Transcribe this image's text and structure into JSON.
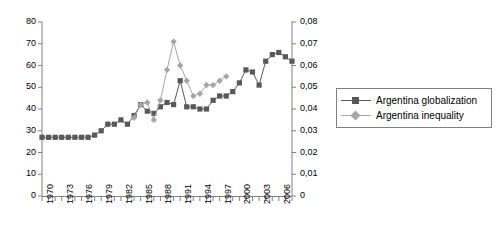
{
  "chart_data": {
    "type": "line",
    "title": "",
    "xlabel": "",
    "ylabel": "",
    "ylabel_right": "",
    "grid": false,
    "legend_position": "right",
    "xlim": [
      1970,
      2008
    ],
    "ylim": [
      0,
      80
    ],
    "ylim_right": [
      0,
      0.08
    ],
    "x_tick_labels": [
      "1970",
      "1973",
      "1976",
      "1979",
      "1982",
      "1985",
      "1988",
      "1991",
      "1994",
      "1997",
      "2000",
      "2003",
      "2006"
    ],
    "y_tick_labels_left": [
      "0",
      "10",
      "20",
      "30",
      "40",
      "50",
      "60",
      "70",
      "80"
    ],
    "y_tick_labels_right": [
      "0",
      "0,01",
      "0,02",
      "0,03",
      "0,04",
      "0,05",
      "0,06",
      "0,07",
      "0,08"
    ],
    "x": [
      1970,
      1971,
      1972,
      1973,
      1974,
      1975,
      1976,
      1977,
      1978,
      1979,
      1980,
      1981,
      1982,
      1983,
      1984,
      1985,
      1986,
      1987,
      1988,
      1989,
      1990,
      1991,
      1992,
      1993,
      1994,
      1995,
      1996,
      1997,
      1998,
      1999,
      2000,
      2001,
      2002,
      2003,
      2004,
      2005,
      2006,
      2007,
      2008
    ],
    "series": [
      {
        "name": "Argentina globalization",
        "axis": "left",
        "color": "#595959",
        "marker": "square",
        "values": [
          27,
          27,
          27,
          27,
          27,
          27,
          27,
          27,
          28,
          30,
          33,
          33,
          35,
          33,
          37,
          42,
          39,
          38,
          41,
          43,
          42,
          53,
          41,
          41,
          40,
          40,
          44,
          46,
          46,
          48,
          52,
          58,
          57,
          51,
          62,
          65,
          66,
          64,
          62
        ]
      },
      {
        "name": "Argentina inequality",
        "axis": "right",
        "color": "#a6a6a6",
        "marker": "diamond",
        "values": [
          null,
          null,
          null,
          null,
          null,
          null,
          null,
          null,
          null,
          null,
          null,
          null,
          null,
          null,
          0.036,
          0.042,
          0.043,
          0.035,
          0.044,
          0.058,
          0.071,
          0.06,
          0.053,
          0.046,
          0.047,
          0.051,
          0.051,
          0.053,
          0.055,
          null,
          null,
          null,
          null,
          null,
          null,
          null,
          null,
          null,
          null
        ]
      }
    ]
  },
  "legend": {
    "items": [
      {
        "label": "Argentina globalization",
        "marker": "square",
        "color": "#595959"
      },
      {
        "label": "Argentina inequality",
        "marker": "diamond",
        "color": "#a6a6a6"
      }
    ]
  },
  "colors": {
    "globalization": "#595959",
    "inequality": "#a6a6a6",
    "axis": "#808080",
    "text": "#000000",
    "background": "#ffffff"
  }
}
